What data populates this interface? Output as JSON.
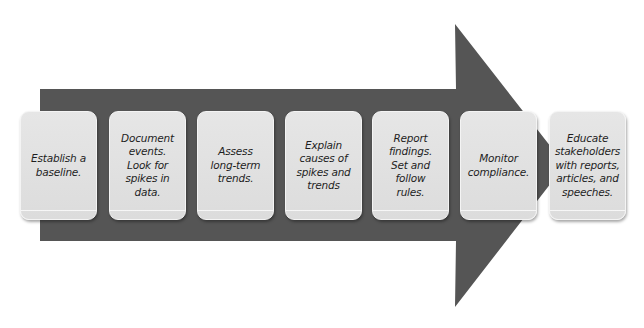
{
  "diagram": {
    "type": "process-arrow",
    "colors": {
      "arrow": "#555555",
      "card_fill": "#e0e0e0",
      "card_border": "#f4f4f4",
      "text": "#1e1e1e",
      "background": "#ffffff"
    },
    "steps": [
      {
        "label": "Establish a\nbaseline."
      },
      {
        "label": "Document\nevents.\nLook for\nspikes in\ndata."
      },
      {
        "label": "Assess\nlong-term\ntrends."
      },
      {
        "label": "Explain\ncauses of\nspikes and\ntrends"
      },
      {
        "label": "Report\nfindings.\nSet and\nfollow\nrules."
      },
      {
        "label": "Monitor\ncompliance."
      },
      {
        "label": "Educate\nstakeholders\nwith reports,\narticles, and\nspeeches."
      }
    ]
  }
}
